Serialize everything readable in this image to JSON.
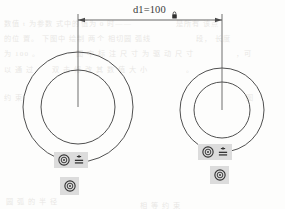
{
  "app": {
    "view_name": "sketch-editor-viewport",
    "background_color": "#fdfdfc",
    "geometry_color": "#3c3c3c",
    "constraint_badge_color": "#dcdcdc",
    "dimension_color": "#3a3a3a"
  },
  "dimension": {
    "name": "d1",
    "label": "d1=100",
    "value": 100,
    "units": "",
    "driving": true,
    "locked": true,
    "lock_icon": "padlock-icon",
    "line_y": 20,
    "left_x": 78,
    "right_x": 222,
    "arrow_style": "filled-arrow"
  },
  "geometry": {
    "circles": [
      {
        "id": "outer-left",
        "cx": 78,
        "cy": 107,
        "r": 55
      },
      {
        "id": "inner-left",
        "cx": 78,
        "cy": 107,
        "r": 37
      },
      {
        "id": "outer-right",
        "cx": 222,
        "cy": 110,
        "r": 42
      },
      {
        "id": "inner-right",
        "cx": 222,
        "cy": 110,
        "r": 28
      }
    ],
    "extension_lines": [
      {
        "id": "ext-left",
        "x": 78,
        "y1": 14,
        "y2": 107
      },
      {
        "id": "ext-right",
        "x": 222,
        "y1": 14,
        "y2": 110
      }
    ]
  },
  "constraints": [
    {
      "id": "left-pair",
      "x": 54,
      "y": 152,
      "width": 34,
      "height": 16,
      "icons": [
        {
          "name": "concentric-constraint-icon",
          "type": "concentric"
        },
        {
          "name": "equal-constraint-icon",
          "type": "equal"
        }
      ]
    },
    {
      "id": "left-single",
      "x": 60,
      "y": 177,
      "width": 19,
      "height": 18,
      "icons": [
        {
          "name": "concentric-constraint-icon",
          "type": "concentric"
        }
      ]
    },
    {
      "id": "right-pair",
      "x": 198,
      "y": 144,
      "width": 34,
      "height": 16,
      "icons": [
        {
          "name": "concentric-constraint-icon",
          "type": "concentric"
        },
        {
          "name": "equal-constraint-icon",
          "type": "equal"
        }
      ]
    },
    {
      "id": "right-single",
      "x": 210,
      "y": 166,
      "width": 19,
      "height": 18,
      "icons": [
        {
          "name": "concentric-constraint-icon",
          "type": "concentric"
        }
      ]
    }
  ],
  "background_text": [
    {
      "x": 4,
      "y": 18,
      "text": "数值 t 为参数 式中的值为 0 时——"
    },
    {
      "x": 176,
      "y": 18,
      "text": "是所有 该点"
    },
    {
      "x": 4,
      "y": 33,
      "text": "的位 置。 下图中 绘制 两个 相切圆 弧线"
    },
    {
      "x": 196,
      "y": 33,
      "text": "段， 长度"
    },
    {
      "x": 4,
      "y": 48,
      "text": "为 100 。"
    },
    {
      "x": 76,
      "y": 48,
      "text": "图 中 标 注 尺 寸 为 驱 动 尺 寸"
    },
    {
      "x": 236,
      "y": 48,
      "text": "，可"
    },
    {
      "x": 4,
      "y": 64,
      "text": "以 通 过"
    },
    {
      "x": 52,
      "y": 64,
      "text": "双 击 修 改 其 数 值 大 小"
    },
    {
      "x": 186,
      "y": 64,
      "text": "。"
    },
    {
      "x": 4,
      "y": 92,
      "text": "约 束"
    },
    {
      "x": 246,
      "y": 92,
      "text": "图"
    },
    {
      "x": 6,
      "y": 196,
      "text": "圆 弧 的 半 径"
    },
    {
      "x": 140,
      "y": 200,
      "text": "相 等 约 束"
    }
  ]
}
